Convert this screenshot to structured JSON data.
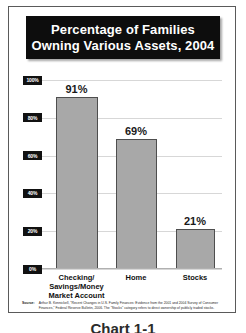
{
  "title": {
    "line1": "Percentage of Families",
    "line2": "Owning Various Assets, 2004"
  },
  "source": {
    "label": "Source:",
    "text": "Arthur B. Kennickell, \"Recent Changes in U.S. Family Finances: Evidence from the 2001 and 2004 Survey of Consumer Finances,\" Federal Reserve Bulletin, 2006. The \"Stocks\" category refers to direct ownership of publicly traded stocks."
  },
  "caption": "Chart 1-1",
  "colors": {
    "bar_fill": "#a8a8a8",
    "bar_border": "#4e4e4e",
    "title_background": "#0d0d0d",
    "title_text": "#ffffff",
    "gridline": "#d7d7d7",
    "frame": "#5a5a5a",
    "tick_badge": "#111111"
  },
  "chart_data": {
    "type": "bar",
    "title": "Percentage of Families Owning Various Assets, 2004",
    "xlabel": "",
    "ylabel": "",
    "ylim": [
      0,
      100
    ],
    "grid": true,
    "legend": "none",
    "categories": [
      "Checking/\nSavings/Money\nMarket Account",
      "Home",
      "Stocks"
    ],
    "category_lines": [
      [
        "Checking/",
        "Savings/Money",
        "Market Account"
      ],
      [
        "Home"
      ],
      [
        "Stocks"
      ]
    ],
    "values": [
      91,
      69,
      21
    ],
    "value_labels": [
      "91%",
      "69%",
      "21%"
    ],
    "ytick_values": [
      100,
      80,
      60,
      40,
      20,
      0
    ],
    "ytick_labels": [
      "100%",
      "80%",
      "60%",
      "40%",
      "20%",
      "0%"
    ]
  }
}
